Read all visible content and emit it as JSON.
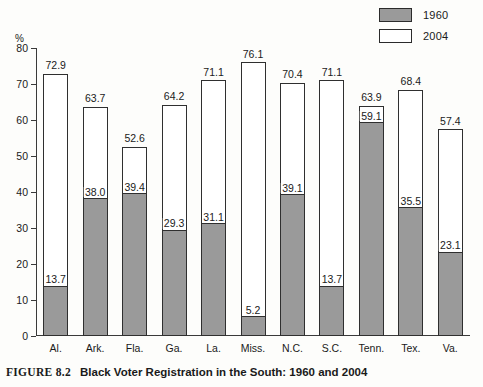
{
  "figure": {
    "number_label": "FIGURE 8.2",
    "caption": "Black Voter Registration in the South: 1960 and 2004"
  },
  "legend": {
    "position": "top-right",
    "items": [
      {
        "label": "1960",
        "swatch": "gray-swatch-icon",
        "color": "#9a9a9a"
      },
      {
        "label": "2004",
        "swatch": "white-swatch-icon",
        "color": "#ffffff"
      }
    ]
  },
  "axis": {
    "y_unit_label": "%",
    "y_ticks": [
      "0",
      "10",
      "20",
      "30",
      "40",
      "50",
      "60",
      "70",
      "80"
    ]
  },
  "chart_data": {
    "type": "bar",
    "title": "Black Voter Registration in the South: 1960 and 2004",
    "xlabel": "",
    "ylabel": "%",
    "ylim": [
      0,
      80
    ],
    "ytick_step": 10,
    "grid": false,
    "legend_position": "top-right",
    "bar_style": "overlaid (1960 drawn inside 2004 outline)",
    "categories": [
      "Al.",
      "Ark.",
      "Fla.",
      "Ga.",
      "La.",
      "Miss.",
      "N.C.",
      "S.C.",
      "Tenn.",
      "Tex.",
      "Va."
    ],
    "series": [
      {
        "name": "1960",
        "color": "#9a9a9a",
        "values": [
          13.7,
          38.0,
          39.4,
          29.3,
          31.1,
          5.2,
          39.1,
          13.7,
          59.1,
          35.5,
          23.1
        ]
      },
      {
        "name": "2004",
        "color": "#ffffff",
        "values": [
          72.9,
          63.7,
          52.6,
          64.2,
          71.1,
          76.1,
          70.4,
          71.1,
          63.9,
          68.4,
          57.4
        ]
      }
    ],
    "data_labels": [
      {
        "category": "Al.",
        "label_1960": "13.7",
        "label_2004": "72.9"
      },
      {
        "category": "Ark.",
        "label_1960": "38.0",
        "label_2004": "63.7"
      },
      {
        "category": "Fla.",
        "label_1960": "39.4",
        "label_2004": "52.6"
      },
      {
        "category": "Ga.",
        "label_1960": "29.3",
        "label_2004": "64.2"
      },
      {
        "category": "La.",
        "label_1960": "31.1",
        "label_2004": "71.1"
      },
      {
        "category": "Miss.",
        "label_1960": "5.2",
        "label_2004": "76.1"
      },
      {
        "category": "N.C.",
        "label_1960": "39.1",
        "label_2004": "70.4"
      },
      {
        "category": "S.C.",
        "label_1960": "13.7",
        "label_2004": "71.1"
      },
      {
        "category": "Tenn.",
        "label_1960": "59.1",
        "label_2004": "63.9"
      },
      {
        "category": "Tex.",
        "label_1960": "35.5",
        "label_2004": "68.4"
      },
      {
        "category": "Va.",
        "label_1960": "23.1",
        "label_2004": "57.4"
      }
    ]
  }
}
